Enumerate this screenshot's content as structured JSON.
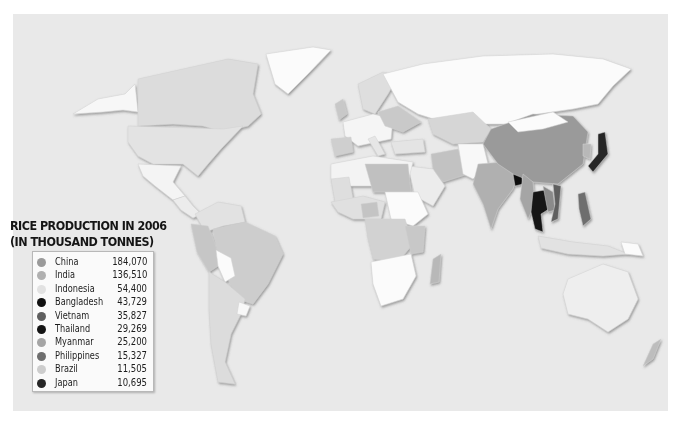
{
  "legend": {
    "title_line1": "RICE PRODUCTION IN 2006",
    "title_line2": "(IN THOUSAND TONNES)",
    "items": [
      {
        "country": "China",
        "value": "184,070",
        "color": "#9a9a9a"
      },
      {
        "country": "India",
        "value": "136,510",
        "color": "#b0b0b0"
      },
      {
        "country": "Indonesia",
        "value": "54,400",
        "color": "#e2e2e2"
      },
      {
        "country": "Bangladesh",
        "value": "43,729",
        "color": "#111111"
      },
      {
        "country": "Vietnam",
        "value": "35,827",
        "color": "#5e5e5e"
      },
      {
        "country": "Thailand",
        "value": "29,269",
        "color": "#141414"
      },
      {
        "country": "Myanmar",
        "value": "25,200",
        "color": "#a5a5a5"
      },
      {
        "country": "Philippines",
        "value": "15,327",
        "color": "#6e6e6e"
      },
      {
        "country": "Brazil",
        "value": "11,505",
        "color": "#cdcdcd"
      },
      {
        "country": "Japan",
        "value": "10,695",
        "color": "#262626"
      }
    ]
  },
  "map": {
    "ocean_color": "#e9e9e9",
    "no_data_color": "#fbfbfb",
    "low_color": "#dadada",
    "mid_color": "#c4c4c4"
  },
  "chart_data": {
    "type": "map",
    "title": "RICE PRODUCTION IN 2006 (IN THOUSAND TONNES)",
    "categories": [
      "China",
      "India",
      "Indonesia",
      "Bangladesh",
      "Vietnam",
      "Thailand",
      "Myanmar",
      "Philippines",
      "Brazil",
      "Japan"
    ],
    "values": [
      184070,
      136510,
      54400,
      43729,
      35827,
      29269,
      25200,
      15327,
      11505,
      10695
    ],
    "unit": "thousand tonnes",
    "legend_position": "left-middle"
  }
}
